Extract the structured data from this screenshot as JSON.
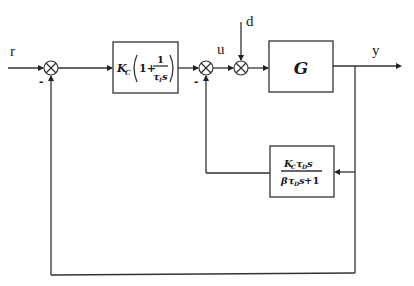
{
  "diagram": {
    "type": "control-block-diagram",
    "signals": {
      "reference": "r",
      "control": "u",
      "disturbance": "d",
      "output": "y"
    },
    "blocks": {
      "pid": {
        "gain": "K",
        "gain_sub": "C",
        "paren_open": "(",
        "one_plus": "1+",
        "frac_num": "1",
        "frac_den_tau": "τ",
        "frac_den_sub": "I",
        "frac_den_s": "s",
        "paren_close": ")"
      },
      "plant": {
        "label": "G"
      },
      "derivative_feedback": {
        "num_k": "K",
        "num_k_sub": "C",
        "num_tau": "τ",
        "num_tau_sub": "D",
        "num_s": "s",
        "den_beta": "β",
        "den_tau": "τ",
        "den_tau_sub": "D",
        "den_s": "s",
        "den_plus_one": " +1"
      }
    },
    "junctions": {
      "sum1_sign": "-",
      "sum2_sign": "-"
    },
    "colors": {
      "line": "#333333",
      "text": "#1a1a1a",
      "background": "#ffffff"
    }
  }
}
